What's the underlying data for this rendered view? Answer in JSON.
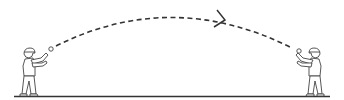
{
  "diagram": {
    "description": "Two figures playing catch; a ball travels along a dashed arc from left thrower to right catcher",
    "stroke_color": "#333333",
    "ground_color": "#333333",
    "figures": [
      {
        "name": "thrower-left",
        "role": "thrower",
        "facing": "right"
      },
      {
        "name": "catcher-right",
        "role": "catcher",
        "facing": "left"
      }
    ],
    "trajectory": {
      "style": "dashed",
      "direction": "left-to-right",
      "arrow": "chevron"
    },
    "ball": {
      "shape": "circle"
    }
  }
}
